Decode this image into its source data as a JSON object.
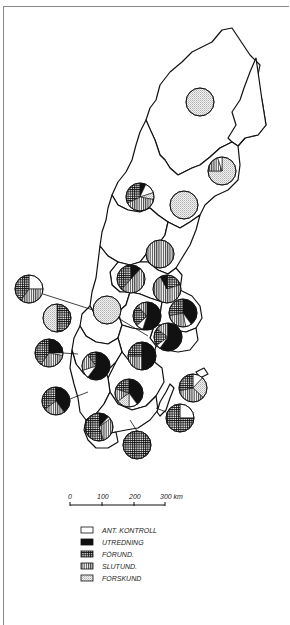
{
  "map": {
    "subject": "Sweden counties — pie charts per county",
    "scale_bar": {
      "ticks": [
        "0",
        "100",
        "200",
        "300 km"
      ],
      "unit": "km"
    },
    "legend": {
      "items": [
        {
          "key": "ant_kontroll",
          "label": "ANT. KONTROLL",
          "pattern": "white"
        },
        {
          "key": "utredning",
          "label": "UTREDNING",
          "pattern": "black"
        },
        {
          "key": "forund",
          "label": "FÖRUND.",
          "pattern": "crosshatch"
        },
        {
          "key": "slutund",
          "label": "SLUTUND.",
          "pattern": "vertical"
        },
        {
          "key": "forskund",
          "label": "FORSKUND",
          "pattern": "dots"
        }
      ]
    },
    "pies": [
      {
        "id": "norrbotten",
        "cx": 200,
        "cy": 102,
        "r": 14,
        "slices": {
          "forskund": 1.0
        }
      },
      {
        "id": "norrbotten-coast",
        "cx": 222,
        "cy": 171,
        "r": 14,
        "slices": {
          "forskund": 0.75,
          "slutund": 0.2,
          "ant_kontroll": 0.05
        }
      },
      {
        "id": "jamtland",
        "cx": 140,
        "cy": 197,
        "r": 14,
        "slices": {
          "utredning": 0.07,
          "ant_kontroll": 0.13,
          "forskund": 0.08,
          "slutund": 0.4,
          "forund": 0.32
        }
      },
      {
        "id": "vasterbotten",
        "cx": 184,
        "cy": 205,
        "r": 14,
        "slices": {
          "forskund": 1.0
        }
      },
      {
        "id": "vasternorrland",
        "cx": 160,
        "cy": 254,
        "r": 14,
        "slices": {
          "slutund": 1.0
        }
      },
      {
        "id": "gavleborg",
        "cx": 131,
        "cy": 279,
        "r": 14,
        "slices": {
          "utredning": 0.12,
          "slutund": 0.5,
          "forund": 0.38
        }
      },
      {
        "id": "kopparberg",
        "cx": 167,
        "cy": 289,
        "r": 14,
        "slices": {
          "forund": 0.2,
          "slutund": 0.72,
          "utredning": 0.08
        }
      },
      {
        "id": "varmland-outer",
        "cx": 29,
        "cy": 289,
        "r": 14,
        "slices": {
          "ant_kontroll": 0.25,
          "slutund": 0.35,
          "forund": 0.4
        }
      },
      {
        "id": "varmland",
        "cx": 107,
        "cy": 310,
        "r": 14,
        "slices": {
          "forskund": 1.0
        }
      },
      {
        "id": "vastmanland",
        "cx": 147,
        "cy": 316,
        "r": 14,
        "slices": {
          "utredning": 0.55,
          "ant_kontroll": 0.08,
          "forund": 0.25,
          "slutund": 0.12
        }
      },
      {
        "id": "uppsala",
        "cx": 183,
        "cy": 313,
        "r": 14,
        "slices": {
          "utredning": 0.4,
          "ant_kontroll": 0.07,
          "slutund": 0.25,
          "forund": 0.28
        }
      },
      {
        "id": "alvsborg-outer",
        "cx": 57,
        "cy": 318,
        "r": 14,
        "slices": {
          "forund": 0.5,
          "forskund": 0.5
        }
      },
      {
        "id": "stockholm",
        "cx": 168,
        "cy": 337,
        "r": 14,
        "slices": {
          "utredning": 0.6,
          "ant_kontroll": 0.05,
          "forund": 0.2,
          "slutund": 0.15
        }
      },
      {
        "id": "goteborg-outer",
        "cx": 49,
        "cy": 353,
        "r": 14,
        "slices": {
          "utredning": 0.25,
          "ant_kontroll": 0.03,
          "slutund": 0.32,
          "forund": 0.4
        }
      },
      {
        "id": "skaraborg",
        "cx": 96,
        "cy": 366,
        "r": 14,
        "slices": {
          "utredning": 0.6,
          "ant_kontroll": 0.1,
          "slutund": 0.2,
          "forund": 0.1
        }
      },
      {
        "id": "sodermanland",
        "cx": 142,
        "cy": 356,
        "r": 14,
        "slices": {
          "utredning": 0.5,
          "slutund": 0.25,
          "forund": 0.25
        }
      },
      {
        "id": "ostergotland",
        "cx": 129,
        "cy": 393,
        "r": 14,
        "slices": {
          "utredning": 0.4,
          "ant_kontroll": 0.1,
          "forskund": 0.15,
          "slutund": 0.15,
          "forund": 0.2
        }
      },
      {
        "id": "halland-outer",
        "cx": 56,
        "cy": 401,
        "r": 14,
        "slices": {
          "utredning": 0.4,
          "slutund": 0.25,
          "forund": 0.35
        }
      },
      {
        "id": "gotland",
        "cx": 193,
        "cy": 388,
        "r": 14,
        "slices": {
          "ant_kontroll": 0.12,
          "forskund": 0.25,
          "slutund": 0.35,
          "forund": 0.28
        }
      },
      {
        "id": "kalmar",
        "cx": 180,
        "cy": 418,
        "r": 14,
        "slices": {
          "ant_kontroll": 0.25,
          "forund": 0.75
        }
      },
      {
        "id": "kronoberg",
        "cx": 99,
        "cy": 427,
        "r": 14,
        "slices": {
          "utredning": 0.12,
          "ant_kontroll": 0.03,
          "slutund": 0.3,
          "forund": 0.55
        }
      },
      {
        "id": "malmohus",
        "cx": 137,
        "cy": 445,
        "r": 14,
        "slices": {
          "forund": 1.0
        }
      }
    ]
  }
}
